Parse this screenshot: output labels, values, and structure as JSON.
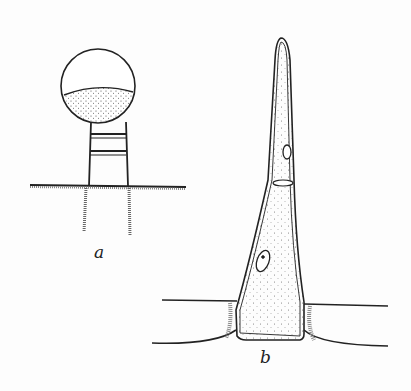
{
  "figure": {
    "panels": [
      {
        "id": "a",
        "label": "a",
        "description": "glandular hair with globular head on stalk of short cells"
      },
      {
        "id": "b",
        "label": "b",
        "description": "long tapering two-celled hair with nuclei"
      }
    ],
    "colors": {
      "ink": "#222222",
      "background": "#fdfdfd"
    }
  }
}
